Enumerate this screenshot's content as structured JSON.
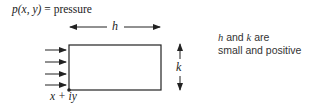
{
  "diagram": {
    "title": {
      "math": "p(x, y)",
      "equals": " = ",
      "text": "pressure"
    },
    "labels": {
      "width": "h",
      "height": "k",
      "corner": "x + iy"
    },
    "note": {
      "line1_h": "h",
      "line1_mid": " and ",
      "line1_k": "k",
      "line1_end": " are",
      "line2": "small and positive"
    },
    "shapes": {
      "rectangle": {
        "x": 69,
        "y": 45,
        "width": 92,
        "height": 45
      },
      "pressure_arrows_count": 4,
      "stroke_color": "#222222"
    }
  }
}
